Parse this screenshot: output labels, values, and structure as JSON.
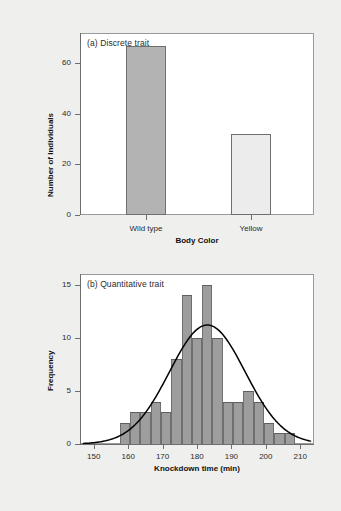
{
  "figure": {
    "background_color": "#efefed",
    "panel_background": "#ffffff",
    "frame_color": "#9a9a9a"
  },
  "chart_data": [
    {
      "type": "bar",
      "panel_label": "(a) Discrete trait",
      "title": "",
      "xlabel": "Body Color",
      "ylabel": "Number of Individuals",
      "categories": [
        "Wild type",
        "Yellow"
      ],
      "values": [
        67,
        32
      ],
      "ylim": [
        0,
        72
      ],
      "yticks": [
        0,
        20,
        40,
        60
      ],
      "ytick_labels": [
        "0",
        "20",
        "40",
        "60"
      ],
      "grid": false,
      "legend": "none",
      "bar_colors": [
        "#b3b3b3",
        "#ececec"
      ],
      "bar_edge_color": "#6f6f6f"
    },
    {
      "type": "bar",
      "panel_label": "(b) Quantitative trait",
      "title": "",
      "xlabel": "Knockdown time (min)",
      "ylabel": "Frequency",
      "xlim": [
        146,
        214
      ],
      "ylim": [
        0,
        16
      ],
      "yticks": [
        0,
        5,
        10,
        15
      ],
      "ytick_labels": [
        "0",
        "5",
        "10",
        "15"
      ],
      "xticks": [
        150,
        160,
        170,
        180,
        190,
        200,
        210
      ],
      "xtick_labels": [
        "150",
        "160",
        "170",
        "180",
        "190",
        "200",
        "210"
      ],
      "bin_edges": [
        157.5,
        160.5,
        163.5,
        166.5,
        169.5,
        172.5,
        175.5,
        178.5,
        181.5,
        184.5,
        187.5,
        190.5,
        193.5,
        196.5,
        199.5,
        202.5,
        205.5,
        208.5,
        211.5
      ],
      "bin_centers": [
        159,
        162,
        165,
        168,
        171,
        174,
        177,
        180,
        183,
        186,
        189,
        192,
        195,
        198,
        201,
        204,
        207,
        210
      ],
      "values": [
        2,
        3,
        3,
        4,
        3,
        8,
        14,
        10,
        15,
        10,
        4,
        4,
        5,
        4,
        2,
        1,
        1,
        0
      ],
      "grid": false,
      "legend": "none",
      "bar_colors": [
        "#9d9d9d"
      ],
      "bar_edge_color": "#6f6f6f",
      "overlay_curve": {
        "name": "normal-distribution-curve",
        "kind": "line",
        "color": "#000000",
        "peak_x": 183,
        "peak_y": 11.2,
        "sigma": 11.0,
        "x_start": 147,
        "x_end": 213
      }
    }
  ]
}
